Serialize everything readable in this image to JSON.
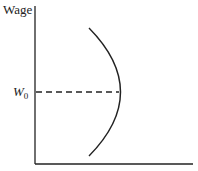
{
  "diagram": {
    "y_axis_label": "Wage",
    "x_axis_label": "",
    "reference_level": {
      "symbol": "W",
      "subscript": "0"
    },
    "colors": {
      "line": "#222222",
      "background": "#ffffff"
    }
  }
}
